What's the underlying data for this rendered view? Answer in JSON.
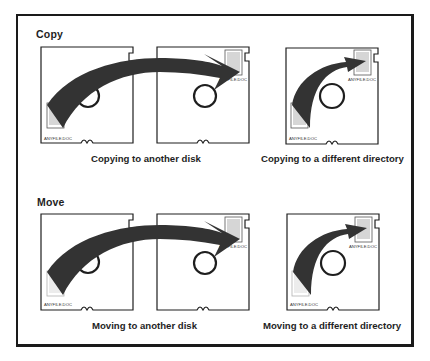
{
  "figure": {
    "sections": [
      {
        "label": "Copy",
        "panels": [
          {
            "caption": "Copying to another disk",
            "file_label_source": "ANYFILE.DOC",
            "file_label_target": "ANYFILE.DOC"
          },
          {
            "caption": "Copying to a different directory",
            "file_label_source": "ANYFILE.DOC",
            "file_label_target": "ANYFILE.DOC"
          }
        ]
      },
      {
        "label": "Move",
        "panels": [
          {
            "caption": "Moving to another disk",
            "file_label_source": "ANYFILE.DOC",
            "file_label_target": "ANYFILE.DOC"
          },
          {
            "caption": "Moving to a different directory",
            "file_label_source": "ANYFILE.DOC",
            "file_label_target": "ANYFILE.DOC"
          }
        ]
      }
    ],
    "colors": {
      "ink": "#1e1e1e",
      "arrow": "#3a3a3a",
      "paper": "#ffffff"
    }
  }
}
